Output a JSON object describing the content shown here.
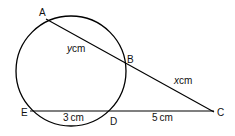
{
  "diagram": {
    "type": "circle-secant-geometry",
    "points": {
      "A": {
        "label": "A",
        "x": 46,
        "y": 19
      },
      "B": {
        "label": "B",
        "x": 126,
        "y": 61
      },
      "C": {
        "label": "C",
        "x": 214,
        "y": 112
      },
      "D": {
        "label": "D",
        "x": 111,
        "y": 111
      },
      "E": {
        "label": "E",
        "x": 30,
        "y": 111
      }
    },
    "circle": {
      "cx": 71,
      "cy": 71,
      "r": 55
    },
    "lengths": {
      "AB": {
        "var": "y",
        "unit": "cm"
      },
      "BC": {
        "var": "x",
        "unit": "cm"
      },
      "ED": {
        "value": "3",
        "unit": "cm"
      },
      "DC": {
        "value": "5",
        "unit": "cm"
      }
    },
    "stroke_color": "#000000"
  }
}
